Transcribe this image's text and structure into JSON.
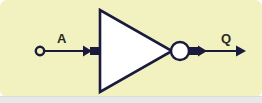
{
  "diagram": {
    "type": "logic-gate-symbol",
    "gate": "NOT",
    "background_color": "#f2f2c0",
    "line_color": "#1a1a3c",
    "fill_color": "#ffffff",
    "bottom_strip_color": "#e8e8e8",
    "input": {
      "label": "A",
      "terminal": "open-circle",
      "terminal_center": [
        40,
        51
      ],
      "wire_from": [
        44,
        51
      ],
      "wire_to": [
        100,
        51
      ]
    },
    "output": {
      "label": "Q",
      "wire_from": [
        188,
        51
      ],
      "wire_to": [
        245,
        51
      ],
      "arrow": "right-arrowhead"
    },
    "body": {
      "shape": "triangle",
      "points": "100,10 100,92 172,51",
      "bubble_center": [
        180,
        51
      ],
      "bubble_radius": 9
    }
  }
}
